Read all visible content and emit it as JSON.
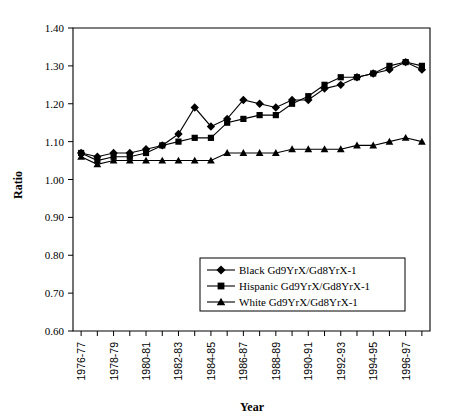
{
  "chart_data": {
    "type": "line",
    "title": "",
    "xlabel": "Year",
    "ylabel": "Ratio",
    "ylim": [
      0.6,
      1.4
    ],
    "ytick_labels": [
      "1.40",
      "1.30",
      "1.20",
      "1.10",
      "1.00",
      "0.90",
      "0.80",
      "0.70",
      "0.60"
    ],
    "ytick_values": [
      1.4,
      1.3,
      1.2,
      1.1,
      1.0,
      0.9,
      0.8,
      0.7,
      0.6
    ],
    "grid": false,
    "legend_position": "lower-right-inside",
    "categories": [
      "1976-77",
      "1977-78",
      "1978-79",
      "1979-80",
      "1980-81",
      "1981-82",
      "1982-83",
      "1983-84",
      "1984-85",
      "1985-86",
      "1986-87",
      "1987-88",
      "1988-89",
      "1989-90",
      "1990-91",
      "1991-92",
      "1992-93",
      "1993-94",
      "1994-95",
      "1995-96",
      "1996-97",
      "1997-98"
    ],
    "xtick_labels_shown": [
      "1976-77",
      "1978-79",
      "1980-81",
      "1982-83",
      "1984-85",
      "1986-87",
      "1988-89",
      "1990-91",
      "1992-93",
      "1994-95",
      "1996-97"
    ],
    "series": [
      {
        "name": "Black Gd9YrX/Gd8YrX-1",
        "marker": "diamond",
        "values": [
          1.07,
          1.06,
          1.07,
          1.07,
          1.08,
          1.09,
          1.12,
          1.19,
          1.14,
          1.16,
          1.21,
          1.2,
          1.19,
          1.21,
          1.21,
          1.24,
          1.25,
          1.27,
          1.28,
          1.29,
          1.31,
          1.29
        ]
      },
      {
        "name": "Hispanic Gd9YrX/Gd8YrX-1",
        "marker": "square",
        "values": [
          1.07,
          1.05,
          1.06,
          1.06,
          1.07,
          1.09,
          1.1,
          1.11,
          1.11,
          1.15,
          1.16,
          1.17,
          1.17,
          1.2,
          1.22,
          1.25,
          1.27,
          1.27,
          1.28,
          1.3,
          1.31,
          1.3
        ]
      },
      {
        "name": "White Gd9YrX/Gd8YrX-1",
        "marker": "triangle",
        "values": [
          1.06,
          1.04,
          1.05,
          1.05,
          1.05,
          1.05,
          1.05,
          1.05,
          1.05,
          1.07,
          1.07,
          1.07,
          1.07,
          1.08,
          1.08,
          1.08,
          1.08,
          1.09,
          1.09,
          1.1,
          1.11,
          1.1
        ]
      }
    ]
  },
  "legend": {
    "entries": [
      {
        "label": "Black Gd9YrX/Gd8YrX-1",
        "marker": "diamond"
      },
      {
        "label": "Hispanic Gd9YrX/Gd8YrX-1",
        "marker": "square"
      },
      {
        "label": "White Gd9YrX/Gd8YrX-1",
        "marker": "triangle"
      }
    ]
  },
  "axes": {
    "y_title": "Ratio",
    "x_title": "Year"
  }
}
